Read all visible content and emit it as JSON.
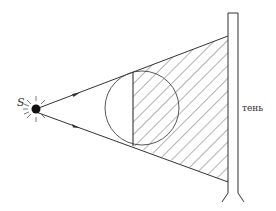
{
  "diagram": {
    "title": "",
    "source_label": "S",
    "shadow_label": "тень",
    "colors": {
      "stroke": "#333333",
      "background": "#ffffff"
    },
    "elements": {
      "source": {
        "type": "point-light-source",
        "label": "S"
      },
      "rays": [
        {
          "name": "upper-ray",
          "arrow": true
        },
        {
          "name": "lower-ray",
          "arrow": true
        }
      ],
      "obstacle": {
        "type": "sphere",
        "shaded_half": "right"
      },
      "screen": {
        "type": "vertical-screen-on-stand"
      },
      "shadow_region": {
        "label": "тень",
        "pattern": "diagonal-hatching"
      }
    }
  }
}
